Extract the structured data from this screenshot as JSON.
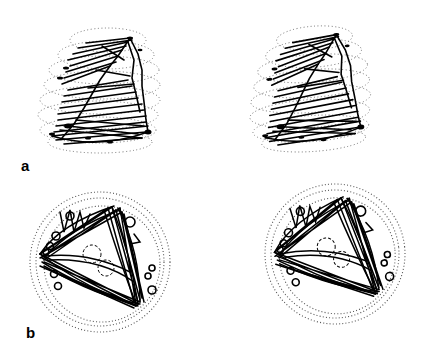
{
  "figure": {
    "panels": [
      {
        "label": "a",
        "view": "side",
        "images": [
          "left-stereo",
          "right-stereo"
        ]
      },
      {
        "label": "b",
        "view": "top",
        "images": [
          "left-stereo",
          "right-stereo"
        ]
      }
    ],
    "colors": {
      "background": "#ffffff",
      "trace": "#000000",
      "envelope_dots": "#555555"
    }
  }
}
